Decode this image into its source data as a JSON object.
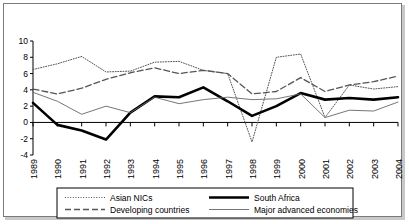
{
  "chart_data": {
    "type": "line",
    "title": "",
    "xlabel": "",
    "ylabel": "",
    "x": [
      1989,
      1990,
      1991,
      1992,
      1993,
      1994,
      1995,
      1996,
      1997,
      1998,
      1999,
      2000,
      2001,
      2002,
      2003,
      2004
    ],
    "tick_labels_x": [
      "1989",
      "1990",
      "1991",
      "1992",
      "1993",
      "1994",
      "1995",
      "1996",
      "1997",
      "1998",
      "1999",
      "2000",
      "2001",
      "2002",
      "2003",
      "2004"
    ],
    "tick_labels_y": [
      "10",
      "8",
      "6",
      "4",
      "2",
      "0",
      "-2",
      "-4"
    ],
    "tick_values_y": [
      10,
      8,
      6,
      4,
      2,
      0,
      -2,
      -4
    ],
    "ylim": [
      -4,
      10
    ],
    "grid": false,
    "legend_position": "bottom",
    "series": [
      {
        "name": "Asian NICs",
        "style": "dotted",
        "color": "#555555",
        "width": 1,
        "values": [
          6.5,
          7.2,
          8.1,
          6.2,
          6.3,
          7.4,
          7.5,
          6.4,
          6.0,
          -2.4,
          8.0,
          8.4,
          0.6,
          4.6,
          4.1,
          4.4
        ]
      },
      {
        "name": "Developing countries",
        "style": "dashed",
        "color": "#555555",
        "width": 1.3,
        "values": [
          4.1,
          3.5,
          4.2,
          5.3,
          6.1,
          6.7,
          6.0,
          6.4,
          6.0,
          3.5,
          3.8,
          5.5,
          3.8,
          4.6,
          5.0,
          5.7
        ]
      },
      {
        "name": "South Africa",
        "style": "solid",
        "color": "#000000",
        "width": 2.6,
        "values": [
          2.4,
          -0.3,
          -1.0,
          -2.1,
          1.2,
          3.2,
          3.1,
          4.3,
          2.6,
          0.8,
          2.0,
          3.6,
          2.8,
          3.0,
          2.8,
          3.1
        ]
      },
      {
        "name": "Major advanced economies",
        "style": "solid",
        "color": "#666666",
        "width": 0.9,
        "values": [
          3.7,
          2.6,
          1.0,
          2.0,
          1.2,
          3.1,
          2.3,
          2.8,
          3.1,
          2.8,
          2.9,
          3.5,
          0.6,
          1.5,
          1.4,
          2.5
        ]
      }
    ]
  },
  "legend": {
    "entries": [
      {
        "label": "Asian NICs",
        "swatch": "dotted-line-swatch"
      },
      {
        "label": "South Africa",
        "swatch": "thick-solid-line-swatch"
      },
      {
        "label": "Developing countries",
        "swatch": "dashed-line-swatch"
      },
      {
        "label": "Major advanced economies",
        "swatch": "thin-solid-line-swatch"
      }
    ]
  }
}
